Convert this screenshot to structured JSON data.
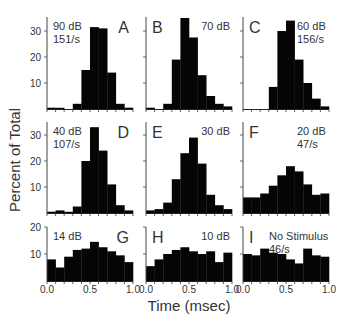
{
  "figure": {
    "ylabel": "Percent of Total",
    "xlabel": "Time (msec)"
  },
  "chart_data": {
    "type": "bar",
    "title": "",
    "xlabel": "Time (msec)",
    "ylabel": "Percent of Total",
    "layout": "3x3 small multiples, shared axes per row",
    "bin_edges": [
      0.0,
      0.1,
      0.2,
      0.3,
      0.4,
      0.5,
      0.6,
      0.7,
      0.8,
      0.9,
      1.0
    ],
    "x_ticks": [
      "0.0",
      "0.5",
      "1.0"
    ],
    "grid": false,
    "rows": [
      {
        "ylim": [
          0,
          35
        ],
        "y_ticks": [
          10,
          20,
          30
        ]
      },
      {
        "ylim": [
          0,
          35
        ],
        "y_ticks": [
          10,
          20,
          30
        ]
      },
      {
        "ylim": [
          0,
          20
        ],
        "y_ticks": [
          10,
          20
        ]
      }
    ],
    "panels": [
      {
        "letter": "A",
        "label": "90 dB",
        "rate": "151/s",
        "row": 0,
        "col": 0,
        "values": [
          0.5,
          0.3,
          0,
          2,
          15,
          31.5,
          31,
          14,
          2,
          0.5
        ]
      },
      {
        "letter": "B",
        "label": "70 dB",
        "rate": "",
        "row": 0,
        "col": 1,
        "values": [
          0.5,
          0,
          2,
          19,
          35,
          27.5,
          13,
          5,
          2,
          1
        ]
      },
      {
        "letter": "C",
        "label": "60 dB",
        "rate": "156/s",
        "row": 0,
        "col": 2,
        "values": [
          0,
          0,
          0,
          8.5,
          30,
          34,
          19,
          10,
          4,
          1
        ]
      },
      {
        "letter": "D",
        "label": "40 dB",
        "rate": "107/s",
        "row": 1,
        "col": 0,
        "values": [
          0.5,
          1,
          0.3,
          2.5,
          20,
          33,
          24,
          11,
          3,
          1
        ]
      },
      {
        "letter": "E",
        "label": "30 dB",
        "rate": "",
        "row": 1,
        "col": 1,
        "values": [
          1,
          1.5,
          4,
          13,
          23,
          29,
          19,
          7,
          3,
          1.5
        ]
      },
      {
        "letter": "F",
        "label": "20 dB",
        "rate": "47/s",
        "row": 1,
        "col": 2,
        "values": [
          6,
          6,
          7.5,
          10.5,
          14.5,
          18,
          16,
          11,
          7,
          7.5
        ]
      },
      {
        "letter": "G",
        "label": "14 dB",
        "rate": "",
        "row": 2,
        "col": 0,
        "values": [
          8,
          5,
          9,
          11.5,
          12,
          14.5,
          12.5,
          11,
          9.5,
          7
        ]
      },
      {
        "letter": "H",
        "label": "10 dB",
        "rate": "",
        "row": 2,
        "col": 1,
        "values": [
          5.5,
          8,
          10,
          11.5,
          12.5,
          11,
          10,
          11,
          7,
          10.5
        ]
      },
      {
        "letter": "I",
        "label": "No Stimulus",
        "rate": "46/s",
        "row": 2,
        "col": 2,
        "values": [
          10,
          9.5,
          12,
          10.5,
          10,
          8,
          6.5,
          12,
          9.5,
          9
        ]
      }
    ]
  }
}
